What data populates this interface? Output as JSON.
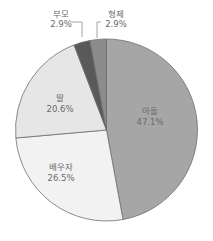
{
  "chart_data": {
    "type": "pie",
    "title": "",
    "start_angle": "12 o'clock",
    "direction": "clockwise",
    "slices": [
      {
        "label": "아들",
        "value": 47.1,
        "display": "47.1%",
        "color": "#a6a6a6"
      },
      {
        "label": "배우자",
        "value": 26.5,
        "display": "26.5%",
        "color": "#f2f2f2"
      },
      {
        "label": "딸",
        "value": 20.6,
        "display": "20.6%",
        "color": "#e6e6e6"
      },
      {
        "label": "부모",
        "value": 2.9,
        "display": "2.9%",
        "color": "#595959"
      },
      {
        "label": "형제",
        "value": 2.9,
        "display": "2.9%",
        "color": "#8c8c8c"
      }
    ],
    "categories": [
      "아들",
      "배우자",
      "딸",
      "부모",
      "형제"
    ],
    "values": [
      47.1,
      26.5,
      20.6,
      2.9,
      2.9
    ],
    "legend": "none (labels on slices, leader lines for 부모 and 형제)"
  },
  "labels": {
    "son": {
      "name": "아들",
      "pct": "47.1%"
    },
    "spouse": {
      "name": "배우자",
      "pct": "26.5%"
    },
    "daughter": {
      "name": "딸",
      "pct": "20.6%"
    },
    "parents": {
      "name": "부모",
      "pct": "2.9%"
    },
    "siblings": {
      "name": "형제",
      "pct": "2.9%"
    }
  }
}
